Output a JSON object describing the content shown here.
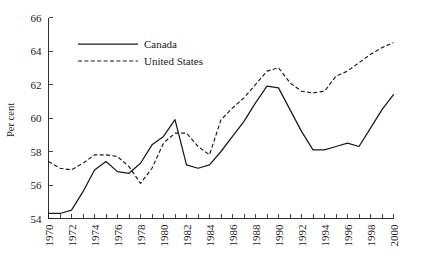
{
  "chart_data": {
    "type": "line",
    "title": "",
    "xlabel": "",
    "ylabel": "Per cent",
    "xlim": [
      1970,
      2000
    ],
    "ylim": [
      54,
      66
    ],
    "yticks": [
      54,
      56,
      58,
      60,
      62,
      64,
      66
    ],
    "ytick_labels": [
      "54",
      "56",
      "58",
      "60",
      "62",
      "64",
      "66"
    ],
    "xticks": [
      1970,
      1971,
      1972,
      1973,
      1974,
      1975,
      1976,
      1977,
      1978,
      1979,
      1980,
      1981,
      1982,
      1983,
      1984,
      1985,
      1986,
      1987,
      1988,
      1989,
      1990,
      1991,
      1992,
      1993,
      1994,
      1995,
      1996,
      1997,
      1998,
      1999,
      2000
    ],
    "xtick_labels": [
      "1970",
      "1972",
      "1974",
      "1976",
      "1978",
      "1980",
      "1982",
      "1984",
      "1986",
      "1988",
      "1990",
      "1992",
      "1994",
      "1996",
      "1998",
      "2000"
    ],
    "xtick_labeled_values": [
      1970,
      1972,
      1974,
      1976,
      1978,
      1980,
      1982,
      1984,
      1986,
      1988,
      1990,
      1992,
      1994,
      1996,
      1998,
      2000
    ],
    "grid": false,
    "legend_position": "upper-left-inside",
    "x": [
      1970,
      1971,
      1972,
      1973,
      1974,
      1975,
      1976,
      1977,
      1978,
      1979,
      1980,
      1981,
      1982,
      1983,
      1984,
      1985,
      1986,
      1987,
      1988,
      1989,
      1990,
      1991,
      1992,
      1993,
      1994,
      1995,
      1996,
      1997,
      1998,
      1999,
      2000
    ],
    "series": [
      {
        "name": "Canada",
        "style": "solid",
        "color": "#1a1a1a",
        "values": [
          54.3,
          54.3,
          54.5,
          55.6,
          56.9,
          57.4,
          56.8,
          56.7,
          57.3,
          58.4,
          58.9,
          59.9,
          57.2,
          57.0,
          57.2,
          58.0,
          58.9,
          59.8,
          60.9,
          61.9,
          61.8,
          60.5,
          59.2,
          58.1,
          58.1,
          58.3,
          58.5,
          58.3,
          59.4,
          60.5,
          61.4
        ]
      },
      {
        "name": "United States",
        "style": "dashed",
        "color": "#1a1a1a",
        "values": [
          57.4,
          57.0,
          56.9,
          57.3,
          57.8,
          57.8,
          57.7,
          57.1,
          56.1,
          57.0,
          58.5,
          59.1,
          59.1,
          58.3,
          57.8,
          59.9,
          60.6,
          61.2,
          62.0,
          62.8,
          63.0,
          62.1,
          61.6,
          61.5,
          61.6,
          62.5,
          62.8,
          63.3,
          63.8,
          64.2,
          64.5
        ]
      }
    ],
    "legend": [
      {
        "label": "Canada",
        "style": "solid"
      },
      {
        "label": "United States",
        "style": "dashed"
      }
    ]
  }
}
